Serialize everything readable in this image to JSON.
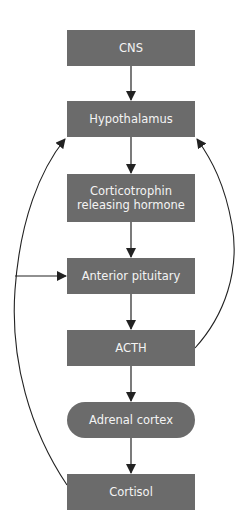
{
  "diagram": {
    "type": "flowchart",
    "colors": {
      "node_fill": "#6b6b6b",
      "node_text": "#f4f4f4",
      "edge": "#222222",
      "background": "#ffffff"
    },
    "nodes": [
      {
        "id": "cns",
        "label": "CNS",
        "shape": "rect"
      },
      {
        "id": "hypothalamus",
        "label": "Hypothalamus",
        "shape": "rect"
      },
      {
        "id": "crh",
        "label": "Corticotrophin releasing hormone",
        "line1": "Corticotrophin",
        "line2": "releasing hormone",
        "shape": "rect"
      },
      {
        "id": "anterior_pituitary",
        "label": "Anterior pituitary",
        "shape": "rect"
      },
      {
        "id": "acth",
        "label": "ACTH",
        "shape": "rect"
      },
      {
        "id": "adrenal_cortex",
        "label": "Adrenal cortex",
        "shape": "pill"
      },
      {
        "id": "cortisol",
        "label": "Cortisol",
        "shape": "rect"
      }
    ],
    "edges": [
      {
        "from": "cns",
        "to": "hypothalamus",
        "kind": "straight"
      },
      {
        "from": "hypothalamus",
        "to": "crh",
        "kind": "straight"
      },
      {
        "from": "crh",
        "to": "anterior_pituitary",
        "kind": "straight"
      },
      {
        "from": "anterior_pituitary",
        "to": "acth",
        "kind": "straight"
      },
      {
        "from": "acth",
        "to": "adrenal_cortex",
        "kind": "straight"
      },
      {
        "from": "adrenal_cortex",
        "to": "cortisol",
        "kind": "straight"
      },
      {
        "from": "cortisol",
        "to": "hypothalamus",
        "kind": "feedback-curve-left"
      },
      {
        "from": "cortisol",
        "to": "anterior_pituitary",
        "kind": "feedback-branch-left"
      },
      {
        "from": "acth",
        "to": "hypothalamus",
        "kind": "feedback-curve-right"
      }
    ]
  }
}
